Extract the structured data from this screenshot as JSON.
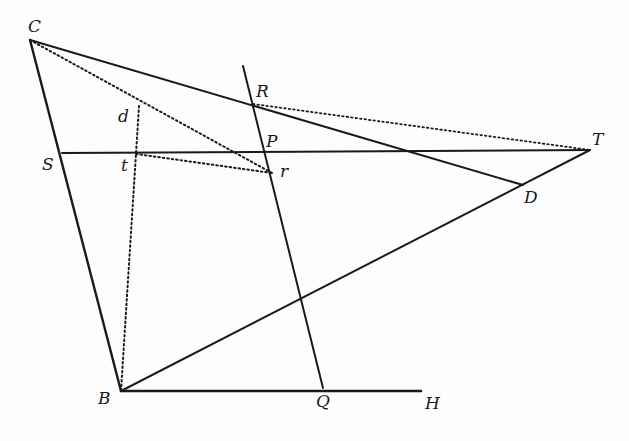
{
  "diagram": {
    "type": "geometric construction",
    "points": {
      "C": {
        "label": "C",
        "x": 30,
        "y": 40,
        "lx": 28,
        "ly": 18
      },
      "R": {
        "label": "R",
        "x": 253,
        "y": 104,
        "lx": 256,
        "ly": 83
      },
      "P": {
        "label": "P",
        "x": 265,
        "y": 152,
        "lx": 266,
        "ly": 133
      },
      "r": {
        "label": "r",
        "x": 272,
        "y": 173,
        "lx": 280,
        "ly": 163
      },
      "T": {
        "label": "T",
        "x": 590,
        "y": 150,
        "lx": 592,
        "ly": 131
      },
      "D": {
        "label": "D",
        "x": 523,
        "y": 185,
        "lx": 524,
        "ly": 189
      },
      "S": {
        "label": "S",
        "x": 62,
        "y": 153,
        "lx": 42,
        "ly": 156
      },
      "d": {
        "label": "d",
        "x": 139,
        "y": 106,
        "lx": 118,
        "ly": 110
      },
      "t": {
        "label": "t",
        "x": 136,
        "y": 154,
        "lx": 121,
        "ly": 158
      },
      "B": {
        "label": "B",
        "x": 121,
        "y": 391,
        "lx": 98,
        "ly": 392
      },
      "Q": {
        "label": "Q",
        "x": 323,
        "y": 388,
        "lx": 316,
        "ly": 393
      },
      "H": {
        "label": "H",
        "x": 421,
        "y": 391,
        "lx": 425,
        "ly": 395
      }
    },
    "solid_lines": [
      {
        "from": "C",
        "to": "B"
      },
      {
        "from": "C",
        "to": "D"
      },
      {
        "from": "S",
        "to": "T"
      },
      {
        "from": "B",
        "to": "T"
      },
      {
        "from": "B",
        "to": "H"
      },
      {
        "from": "top",
        "to": "Q",
        "note": "line through R, P, r to Q"
      }
    ],
    "dotted_lines": [
      {
        "from": "C",
        "to": "r"
      },
      {
        "from": "R",
        "to": "T"
      },
      {
        "from": "t",
        "to": "r"
      },
      {
        "from": "d",
        "to": "B"
      }
    ],
    "colors": {
      "ink": "#1a1a1a",
      "background": "#fdfdfd"
    }
  }
}
